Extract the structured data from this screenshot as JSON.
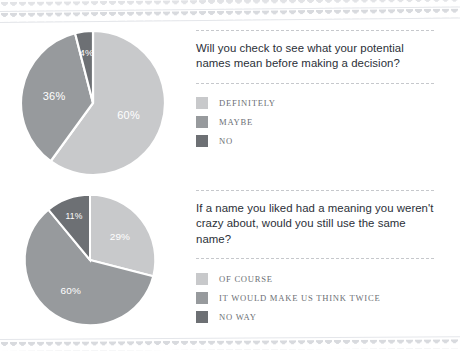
{
  "decor": {
    "top_border": "scalloped-border",
    "bottom_border": "scalloped-border"
  },
  "palette": {
    "light": "#c8c9cb",
    "medium": "#979a9d",
    "dark": "#6d7074",
    "rule": "#c6c8cc",
    "question_text": "#2b2f38",
    "legend_text": "#6c6f75",
    "slice_label": "#ffffff",
    "background": "#ffffff"
  },
  "sections": [
    {
      "question": "Will you check to see what your potential names mean before making a decision?",
      "legend": [
        {
          "label": "DEFINITELY",
          "color": "#c8c9cb"
        },
        {
          "label": "MAYBE",
          "color": "#979a9d"
        },
        {
          "label": "NO",
          "color": "#6d7074"
        }
      ]
    },
    {
      "question": "If a name you liked had a meaning you weren't crazy about, would you still use the same name?",
      "legend": [
        {
          "label": "OF COURSE",
          "color": "#c8c9cb"
        },
        {
          "label": "IT WOULD MAKE US THINK TWICE",
          "color": "#979a9d"
        },
        {
          "label": "NO WAY",
          "color": "#6d7074"
        }
      ]
    }
  ],
  "chart_data": [
    {
      "type": "pie",
      "title": "Will you check to see what your potential names mean before making a decision?",
      "categories": [
        "DEFINITELY",
        "MAYBE",
        "NO"
      ],
      "values": [
        60,
        36,
        4
      ],
      "labels": [
        "60%",
        "36%",
        "4%"
      ],
      "colors": [
        "#c8c9cb",
        "#979a9d",
        "#6d7074"
      ],
      "start_angle_deg": 0,
      "direction": "clockwise",
      "legend_position": "right"
    },
    {
      "type": "pie",
      "title": "If a name you liked had a meaning you weren't crazy about, would you still use the same name?",
      "categories": [
        "OF COURSE",
        "IT WOULD MAKE US THINK TWICE",
        "NO WAY"
      ],
      "values": [
        29,
        60,
        11
      ],
      "labels": [
        "29%",
        "60%",
        "11%"
      ],
      "colors": [
        "#c8c9cb",
        "#979a9d",
        "#6d7074"
      ],
      "start_angle_deg": 0,
      "direction": "clockwise",
      "legend_position": "right"
    }
  ]
}
